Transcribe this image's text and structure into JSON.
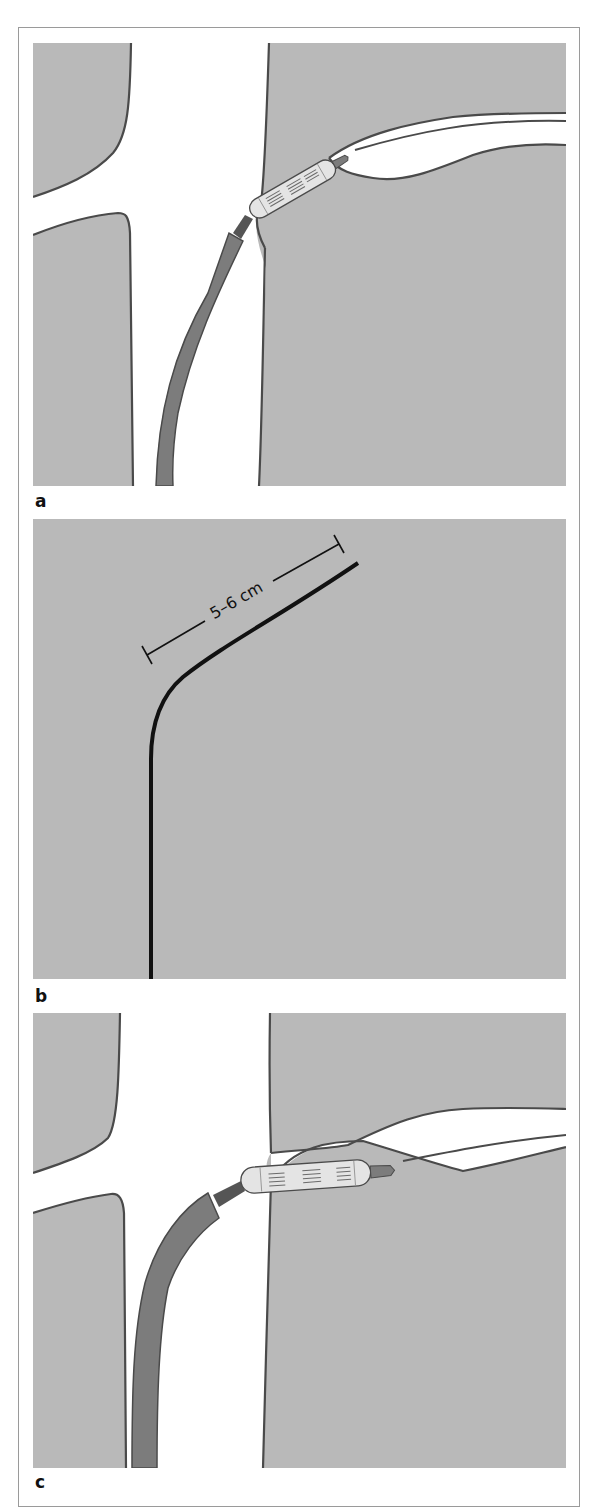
{
  "figure": {
    "panels": [
      {
        "id": "a",
        "label": "a",
        "description": "Catheter advanced through main vessel into side branch with stent (balloon-mounted) crossing the ostium"
      },
      {
        "id": "b",
        "label": "b",
        "description": "Guide wire shaped with distal bend",
        "measurement_label": "5–6 cm"
      },
      {
        "id": "c",
        "label": "c",
        "description": "Stent positioned within side branch ostium, catheter tip at branch origin"
      }
    ],
    "colors": {
      "tissue": "#b9b9b9",
      "vessel_lumen": "#ffffff",
      "vessel_wall": "#4a4a4a",
      "catheter": "#7c7c7c",
      "stent_body": "#e4e4e4",
      "stent_struts": "#6a6a6a",
      "wire": "#111111",
      "frame_border": "#9a9a9a"
    }
  }
}
